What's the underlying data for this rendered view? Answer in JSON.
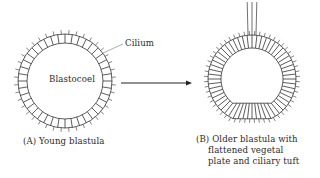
{
  "figure": {
    "panel_a": {
      "label": "(A) Young blastula",
      "cavity_label": "Blastocoel",
      "pointer_label": "Cilium"
    },
    "panel_b": {
      "label_lines": [
        "(B) Older blastula with",
        "flattened vegetal",
        "plate and ciliary tuft"
      ]
    },
    "arrow": "development-arrow",
    "colors": {
      "line": "#333333",
      "background": "#ffffff"
    }
  }
}
